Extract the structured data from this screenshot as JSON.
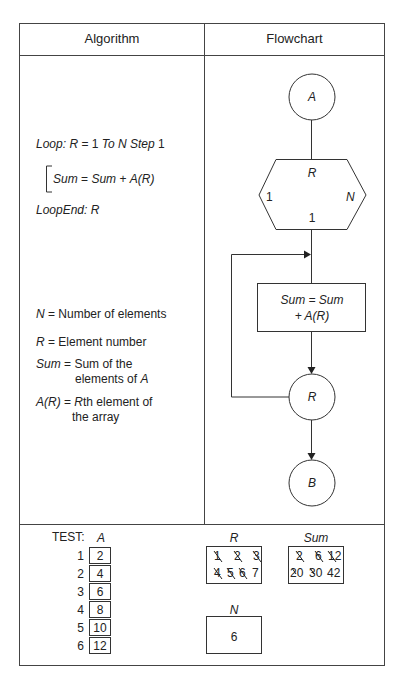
{
  "header": {
    "left": "Algorithm",
    "right": "Flowchart"
  },
  "algorithm": {
    "loop_line": {
      "kw": "Loop:",
      "var": "R",
      "eq": " = 1 ",
      "to": "To",
      "n": " N ",
      "step": "Step",
      "stepval": " 1"
    },
    "body": {
      "lhs": "Sum",
      "eq": " = ",
      "rhs1": "Sum",
      "plus": " + ",
      "rhs2": "A(R)"
    },
    "end_line": {
      "kw": "LoopEnd:",
      "var": " R"
    },
    "definitions": [
      {
        "term": "N",
        "eq": " = ",
        "desc": "Number of elements",
        "desc2": ""
      },
      {
        "term": "R",
        "eq": " = ",
        "desc": "Element number",
        "desc2": ""
      },
      {
        "term": "Sum",
        "eq": " = ",
        "desc": "Sum of the",
        "desc2": "elements of ",
        "desc2_it": "A"
      },
      {
        "term": "A(R)",
        "eq": " = ",
        "desc_it": "R",
        "desc": "th element of",
        "desc2": "the array"
      }
    ]
  },
  "flowchart": {
    "start_connector": "A",
    "loop_hex": {
      "var": "R",
      "start": "1",
      "end": "N",
      "step": "1"
    },
    "process": {
      "line1": "Sum = Sum",
      "line2": "+ A(R)"
    },
    "loop_end_connector": "R",
    "end_connector": "B"
  },
  "test": {
    "label": "TEST:",
    "array_name": "A",
    "array": [
      {
        "i": "1",
        "v": "2"
      },
      {
        "i": "2",
        "v": "4"
      },
      {
        "i": "3",
        "v": "6"
      },
      {
        "i": "4",
        "v": "8"
      },
      {
        "i": "5",
        "v": "10"
      },
      {
        "i": "6",
        "v": "12"
      }
    ],
    "r_box": {
      "title": "R",
      "crossed": [
        "1",
        "2",
        "3",
        "4",
        "5",
        "6"
      ],
      "final": "7"
    },
    "sum_box": {
      "title": "Sum",
      "crossed": [
        "2",
        "6",
        "12",
        "20",
        "30"
      ],
      "final": "42"
    },
    "n_box": {
      "title": "N",
      "value": "6"
    }
  }
}
